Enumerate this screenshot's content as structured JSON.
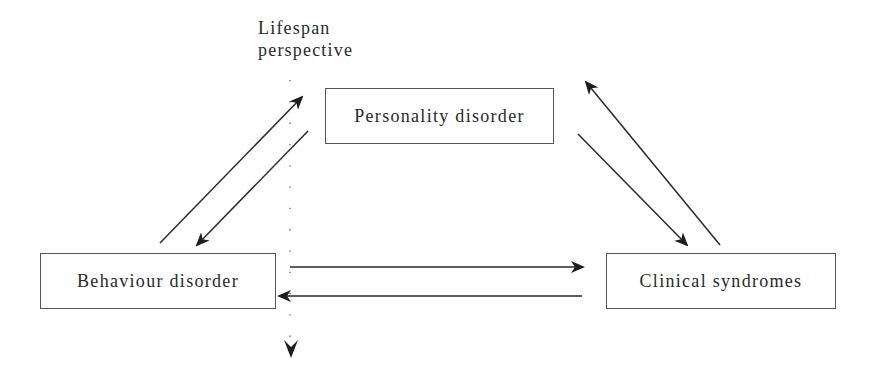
{
  "diagram": {
    "axis_label_line1": "Lifespan",
    "axis_label_line2": "perspective",
    "nodes": {
      "personality": "Personality disorder",
      "behaviour": "Behaviour disorder",
      "clinical": "Clinical syndromes"
    },
    "edges": [
      {
        "from": "Behaviour disorder",
        "to": "Personality disorder"
      },
      {
        "from": "Personality disorder",
        "to": "Behaviour disorder"
      },
      {
        "from": "Personality disorder",
        "to": "Clinical syndromes"
      },
      {
        "from": "Clinical syndromes",
        "to": "Personality disorder"
      },
      {
        "from": "Behaviour disorder",
        "to": "Clinical syndromes"
      },
      {
        "from": "Clinical syndromes",
        "to": "Behaviour disorder"
      }
    ],
    "colors": {
      "line": "#2a2a2a",
      "box_border": "#555555"
    }
  }
}
